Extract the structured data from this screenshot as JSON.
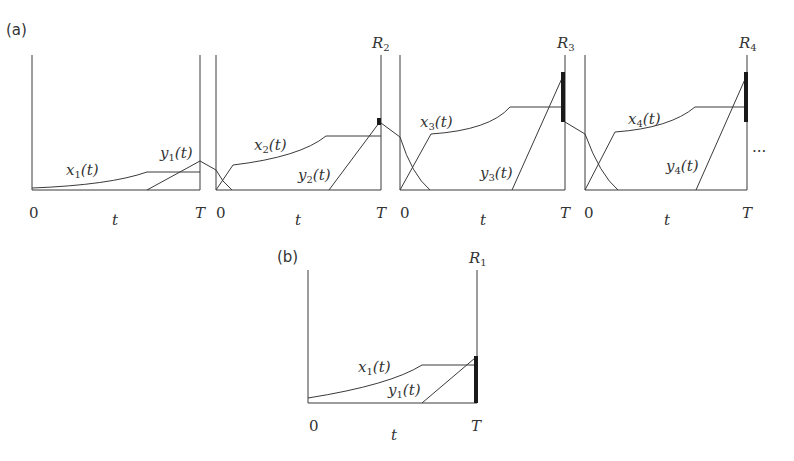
{
  "figure": {
    "panel_a_label": "(a)",
    "panel_b_label": "(b)",
    "ellipsis": "...",
    "panels_a": [
      {
        "x_label": "x",
        "x_sub": "1",
        "y_label": "y",
        "y_sub": "1",
        "r_label": "",
        "r_sub": "",
        "zero": "0",
        "T": "T",
        "t": "t",
        "arg": "(t)"
      },
      {
        "x_label": "x",
        "x_sub": "2",
        "y_label": "y",
        "y_sub": "2",
        "r_label": "R",
        "r_sub": "2",
        "zero": "0",
        "T": "T",
        "t": "t",
        "arg": "(t)"
      },
      {
        "x_label": "x",
        "x_sub": "3",
        "y_label": "y",
        "y_sub": "3",
        "r_label": "R",
        "r_sub": "3",
        "zero": "0",
        "T": "T",
        "t": "t",
        "arg": "(t)"
      },
      {
        "x_label": "x",
        "x_sub": "4",
        "y_label": "y",
        "y_sub": "4",
        "r_label": "R",
        "r_sub": "4",
        "zero": "0",
        "T": "T",
        "t": "t",
        "arg": "(t)"
      }
    ],
    "panel_b": {
      "x_label": "x",
      "x_sub": "1",
      "y_label": "y",
      "y_sub": "1",
      "r_label": "R",
      "r_sub": "1",
      "zero": "0",
      "T": "T",
      "t": "t",
      "arg": "(t)"
    }
  }
}
